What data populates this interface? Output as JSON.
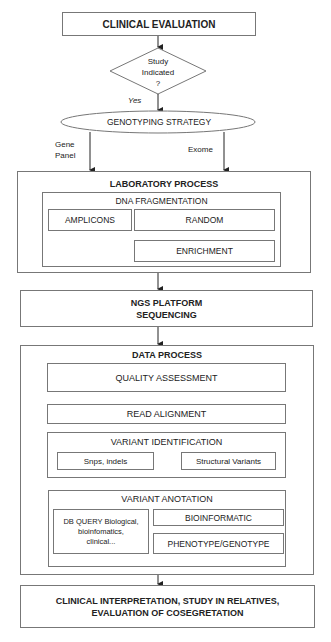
{
  "start": {
    "label": "CLINICAL EVALUATION"
  },
  "decision": {
    "line1": "Study",
    "line2": "Indicated",
    "line3": "?"
  },
  "yes_label": "Yes",
  "strategy": {
    "label": "GENOTYPING STRATEGY"
  },
  "branches": {
    "left": {
      "line1": "Gene",
      "line2": "Panel"
    },
    "right": "Exome"
  },
  "laboratory": {
    "title": "LABORATORY PROCESS",
    "fragmentation": {
      "title": "DNA FRAGMENTATION",
      "amplicons": "AMPLICONS",
      "random": "RANDOM",
      "enrichment": "ENRICHMENT"
    }
  },
  "ngs": {
    "line1": "NGS PLATFORM",
    "line2": "SEQUENCING"
  },
  "data_process": {
    "title": "DATA PROCESS",
    "quality": "QUALITY ASSESSMENT",
    "alignment": "READ ALIGNMENT",
    "variant_identification": {
      "title": "VARIANT IDENTIFICATION",
      "snps": "Snps, indels",
      "structural": "Structural Variants"
    },
    "variant_annotation": {
      "title": "VARIANT ANOTATION",
      "db_query": {
        "line1": "DB QUERY Biological,",
        "line2": "bioinfomatics,",
        "line3": "clinical..."
      },
      "bioinformatic": "BIOINFORMATIC",
      "phenotype": "PHENOTYPE/GENOTYPE"
    }
  },
  "end": {
    "line1": "CLINICAL INTERPRETATION, STUDY IN RELATIVES,",
    "line2": "EVALUATION OF COSEGRETATION"
  }
}
